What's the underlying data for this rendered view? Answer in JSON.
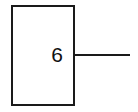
{
  "diagram": {
    "node": {
      "label": "6",
      "border_color": "#1a1a1a",
      "fill_color": "#ffffff"
    },
    "connector": {
      "direction": "right",
      "color": "#1a1a1a"
    }
  }
}
